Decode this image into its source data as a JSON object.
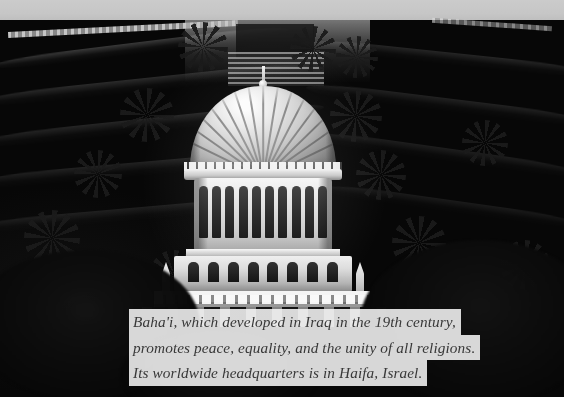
{
  "photo": {
    "subject": "shrine-of-the-bab",
    "location_depicted": "Haifa, Israel",
    "alt_description": "Aerial view of the domed Shrine of the Bab surrounded by terraced Baha'i gardens on Mount Carmel",
    "treatment": "grayscale",
    "elements": {
      "dome_label": "ribbed dome",
      "colonnade_label": "arched colonnade",
      "gardens_label": "terraced gardens",
      "palms_label": "palm trees",
      "balustrade_label": "balustrade"
    }
  },
  "caption": {
    "lines": [
      "Baha'i, which developed in Iraq in the 19th century,",
      "promotes peace, equality, and the unity of all religions.",
      "Its worldwide headquarters is in Haifa, Israel."
    ],
    "full_text": "Baha'i, which developed in Iraq in the 19th century, promotes peace, equality, and the unity of all religions. Its worldwide headquarters is in Haifa, Israel.",
    "text_color": "#3b3b3b",
    "background_color": "rgba(244,243,238,0.88)"
  },
  "colors": {
    "sky": "#c4c6c2",
    "page_background": "#ffffff",
    "foliage_dark": "#0d0f0a",
    "stone_light": "#f4f2ea"
  }
}
